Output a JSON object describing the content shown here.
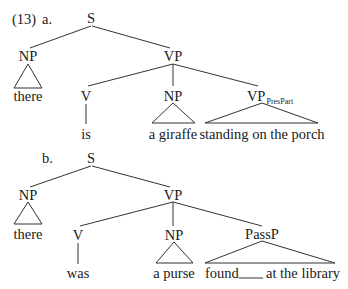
{
  "example_number": "(13)",
  "trees": [
    {
      "label": "a.",
      "root": "S",
      "subject": {
        "category": "NP",
        "text": "there"
      },
      "predicate": {
        "category": "VP",
        "verb": {
          "category": "V",
          "text": "is"
        },
        "object": {
          "category": "NP",
          "text": "a giraffe"
        },
        "complement": {
          "category": "VP",
          "subscript": "PresPart",
          "text": "standing on the porch"
        }
      }
    },
    {
      "label": "b.",
      "root": "S",
      "subject": {
        "category": "NP",
        "text": "there"
      },
      "predicate": {
        "category": "VP",
        "verb": {
          "category": "V",
          "text": "was"
        },
        "object": {
          "category": "NP",
          "text": "a purse"
        },
        "complement": {
          "category": "PassP",
          "text_before_gap": "found",
          "gap": "____",
          "text_after_gap": "at the library"
        }
      }
    }
  ]
}
